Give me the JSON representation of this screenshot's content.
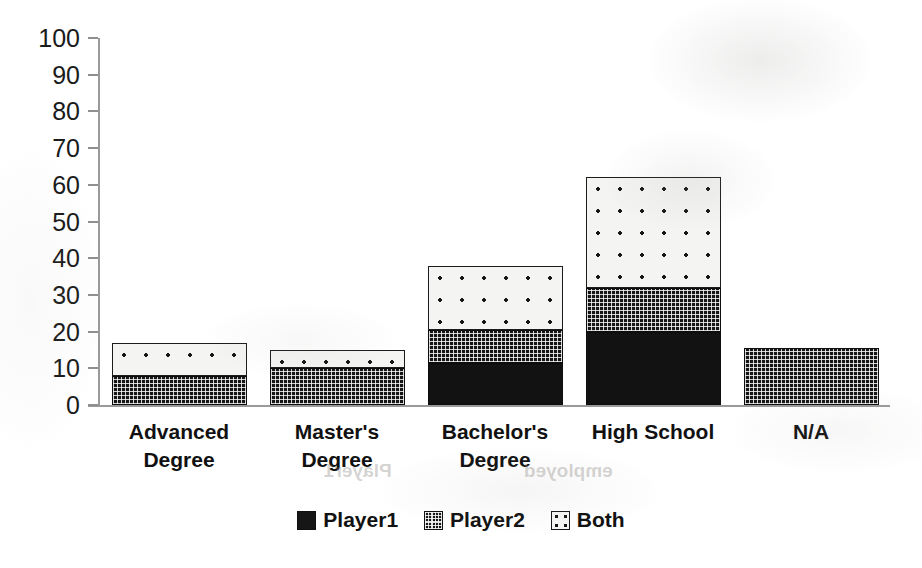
{
  "chart_data": {
    "type": "bar",
    "subtype": "stacked-bar",
    "title": "",
    "xlabel": "",
    "ylabel": "",
    "ylim": [
      0,
      100
    ],
    "yticks": [
      0,
      10,
      20,
      30,
      40,
      50,
      60,
      70,
      80,
      90,
      100
    ],
    "grid": false,
    "legend_position": "bottom-center",
    "categories": [
      "Advanced Degree",
      "Master's Degree",
      "Bachelor's Degree",
      "High School",
      "N/A"
    ],
    "category_lines": [
      [
        "Advanced",
        "Degree"
      ],
      [
        "Master's",
        "Degree"
      ],
      [
        "Bachelor's",
        "Degree"
      ],
      [
        "High School"
      ],
      [
        "N/A"
      ]
    ],
    "series": [
      {
        "name": "Player1",
        "pattern": "solid-black",
        "color": "#161616",
        "values": [
          0,
          0,
          11.5,
          20,
          0
        ]
      },
      {
        "name": "Player2",
        "pattern": "dense-checker",
        "color": "#161616",
        "values": [
          8,
          10,
          9,
          12,
          15.5
        ]
      },
      {
        "name": "Both",
        "pattern": "sparse-dots",
        "color": "#f4f4f2",
        "values": [
          9,
          5,
          17.5,
          30,
          0
        ]
      }
    ],
    "totals": [
      17,
      15,
      38,
      62,
      15.5
    ]
  },
  "legend": {
    "items": [
      {
        "label": "Player1",
        "swatch": "solid-black-swatch"
      },
      {
        "label": "Player2",
        "swatch": "dense-checker-swatch"
      },
      {
        "label": "Both",
        "swatch": "sparse-dots-swatch"
      }
    ]
  },
  "artifacts": {
    "ghost_text_1": "employed",
    "ghost_text_2": "Player1"
  }
}
